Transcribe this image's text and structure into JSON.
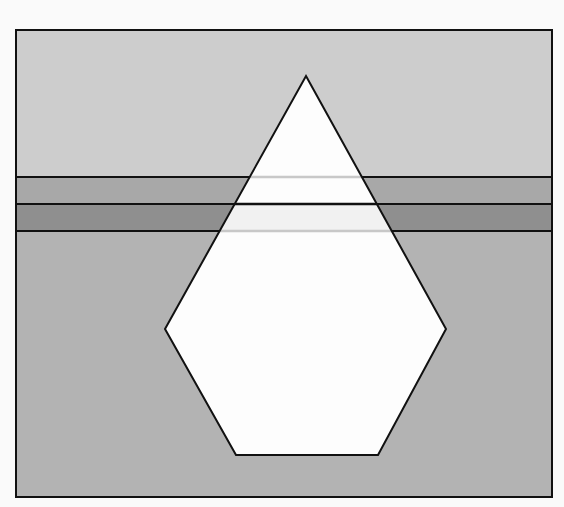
{
  "diagram": {
    "background": "#fafafa",
    "frame": {
      "x": 16,
      "y": 30,
      "width": 536,
      "height": 467,
      "stroke": "#111111"
    },
    "regions": [
      {
        "name": "top-region",
        "y1": 30,
        "y2": 177,
        "fill": "#cdcdcd"
      },
      {
        "name": "upper-band",
        "y1": 177,
        "y2": 204,
        "fill": "#a8a8a8"
      },
      {
        "name": "lower-band",
        "y1": 204,
        "y2": 231,
        "fill": "#8f8f8f"
      },
      {
        "name": "bottom-region",
        "y1": 231,
        "y2": 497,
        "fill": "#b3b3b3"
      }
    ],
    "gem": {
      "points": [
        [
          306,
          76
        ],
        [
          446,
          329
        ],
        [
          378,
          455
        ],
        [
          236,
          455
        ],
        [
          165,
          329
        ]
      ],
      "fill": "#fdfdfd",
      "stroke": "#111111",
      "inner_band_fill": "#f1f1f1"
    },
    "lines": [
      {
        "y": 177,
        "inside_stroke": "#c8c8c8"
      },
      {
        "y": 204,
        "inside_stroke": "#111111"
      },
      {
        "y": 231,
        "inside_stroke": "#c8c8c8"
      }
    ]
  }
}
